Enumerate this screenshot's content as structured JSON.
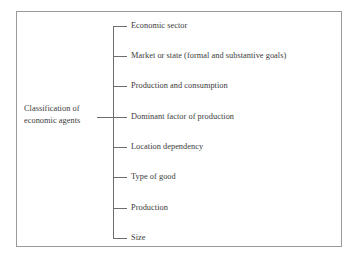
{
  "diagram": {
    "type": "tree",
    "orientation": "left-to-right",
    "title": "Classification of economic agents",
    "frame": {
      "border_color": "#9a9a9a",
      "background_color": "#ffffff"
    },
    "line_color": "#6d6d6d",
    "text_color": "#3a3a3a",
    "root": {
      "label": "Classification of economic agents",
      "line1": "Classification of",
      "line2": "economic agents"
    },
    "branches": [
      {
        "index": 1,
        "label": "Economic sector"
      },
      {
        "index": 2,
        "label": "Market or state (formal and substantive goals)"
      },
      {
        "index": 3,
        "label": "Production and consumption"
      },
      {
        "index": 4,
        "label": "Dominant factor of production"
      },
      {
        "index": 5,
        "label": "Location dependency"
      },
      {
        "index": 6,
        "label": "Type of good"
      },
      {
        "index": 7,
        "label": "Production"
      },
      {
        "index": 8,
        "label": "Size"
      }
    ]
  }
}
